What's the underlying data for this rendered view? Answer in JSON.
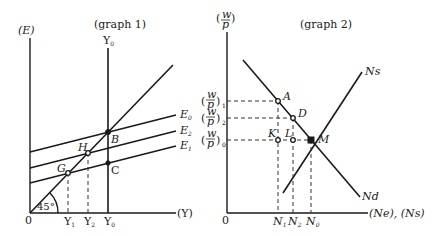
{
  "graph1": {
    "title": "(graph 1)",
    "y_axis_label": "(E)",
    "x_axis_label": "(Y)",
    "origin_label": "0",
    "angle_label": "45°",
    "vertical_line_label": "Y",
    "vertical_line_sub": "0",
    "lines": [
      {
        "name": "E",
        "sub": "0"
      },
      {
        "name": "E",
        "sub": "2"
      },
      {
        "name": "E",
        "sub": "1"
      }
    ],
    "points": [
      "B",
      "H",
      "G",
      "C"
    ],
    "x_ticks": [
      {
        "label": "Y",
        "sub": "1"
      },
      {
        "label": "Y",
        "sub": "2"
      },
      {
        "label": "Y",
        "sub": "0"
      }
    ]
  },
  "graph2": {
    "title": "(graph 2)",
    "y_axis_label_num": "w",
    "y_axis_label_den": "p",
    "x_axis_label": "(Ne), (Ns)",
    "origin_label": "0",
    "supply_label": "Ns",
    "demand_label": "Nd",
    "y_ticks": [
      {
        "num": "w",
        "den": "p",
        "sub": "1"
      },
      {
        "num": "w",
        "den": "p",
        "sub": "2"
      },
      {
        "num": "w",
        "den": "p",
        "sub": "0"
      }
    ],
    "points": [
      "A",
      "D",
      "K",
      "L",
      "M"
    ],
    "x_ticks": [
      {
        "label": "N",
        "sub": "1"
      },
      {
        "label": "N",
        "sub": "2"
      },
      {
        "label": "N",
        "sub": "0"
      }
    ]
  }
}
